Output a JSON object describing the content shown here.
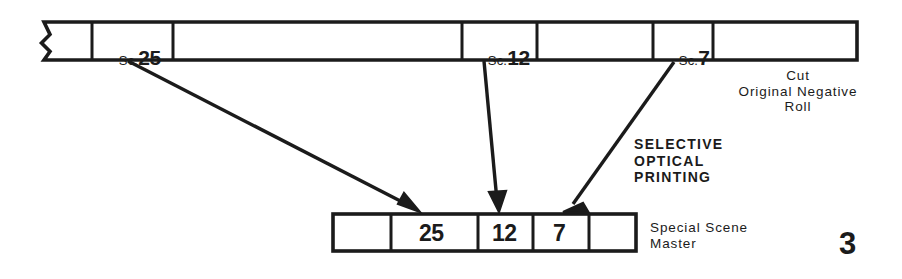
{
  "figure": {
    "page_number": "3",
    "ink_color": "#1b1b1b",
    "paper_color": "#ffffff"
  },
  "top_strip": {
    "name": "cut-original-negative-roll",
    "caption_lines": [
      "Cut",
      "Original Negative",
      "Roll"
    ],
    "caption": "Cut\nOriginal Negative\nRoll",
    "has_left_break_edge": true,
    "cells": [
      {
        "prefix": "",
        "number": "",
        "label": ""
      },
      {
        "prefix": "Sc.",
        "number": "25",
        "label": "Sc.25"
      },
      {
        "prefix": "",
        "number": "",
        "label": ""
      },
      {
        "prefix": "Sc.",
        "number": "12",
        "label": "Sc.12"
      },
      {
        "prefix": "",
        "number": "",
        "label": ""
      },
      {
        "prefix": "Sc.",
        "number": "7",
        "label": "Sc. 7"
      },
      {
        "prefix": "",
        "number": "",
        "label": ""
      }
    ]
  },
  "process_note": {
    "lines": [
      "SELECTIVE",
      "OPTICAL",
      "PRINTING"
    ],
    "text": "SELECTIVE\nOPTICAL\nPRINTING"
  },
  "bottom_strip": {
    "name": "special-scene-master",
    "caption_lines": [
      "Special Scene",
      "Master"
    ],
    "caption": "Special Scene\nMaster",
    "cells": [
      {
        "label": ""
      },
      {
        "label": "25"
      },
      {
        "label": "12"
      },
      {
        "label": "7"
      },
      {
        "label": ""
      }
    ]
  },
  "arrows": [
    {
      "from_scene": "25",
      "to_scene": "25"
    },
    {
      "from_scene": "12",
      "to_scene": "12"
    },
    {
      "from_scene": "7",
      "to_scene": "7"
    }
  ]
}
